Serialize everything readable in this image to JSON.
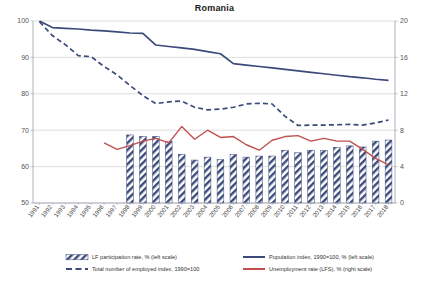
{
  "chart_data": {
    "type": "line",
    "title": "Romania",
    "xlabel": "",
    "ylabel_left": "",
    "ylabel_right": "",
    "grid": true,
    "legend_position": "bottom",
    "x": [
      1991,
      1992,
      1993,
      1994,
      1995,
      1996,
      1997,
      1998,
      1999,
      2000,
      2001,
      2002,
      2003,
      2004,
      2005,
      2006,
      2007,
      2008,
      2009,
      2010,
      2011,
      2012,
      2013,
      2014,
      2015,
      2016,
      2017,
      2018
    ],
    "left_axis": {
      "min": 50,
      "max": 100,
      "ticks": [
        50,
        60,
        70,
        80,
        90,
        100
      ]
    },
    "right_axis": {
      "min": 0,
      "max": 20,
      "ticks": [
        0,
        4,
        8,
        12,
        16,
        20
      ]
    },
    "series": [
      {
        "name": "LF participation rate, % (left scale)",
        "key": "lf_participation",
        "type": "bar",
        "axis": "left",
        "color": "#3b4a7a",
        "pattern": "diagonal-hatch",
        "values": [
          null,
          null,
          null,
          null,
          null,
          null,
          null,
          68.7,
          68.3,
          68.3,
          67.0,
          63.4,
          61.8,
          62.6,
          61.9,
          63.3,
          62.6,
          62.9,
          62.9,
          64.5,
          63.8,
          64.5,
          64.4,
          65.3,
          65.7,
          65.4,
          67.0,
          67.3
        ]
      },
      {
        "name": "Population index, 1990=100, % (left scale)",
        "key": "population_index",
        "type": "line",
        "axis": "left",
        "color": "#3b4a7a",
        "style": "solid",
        "values": [
          100.0,
          98.2,
          98.0,
          97.8,
          97.5,
          97.3,
          97.0,
          96.7,
          96.6,
          93.4,
          93.0,
          92.6,
          92.2,
          91.6,
          91.0,
          88.3,
          87.9,
          87.5,
          87.1,
          86.7,
          86.3,
          85.9,
          85.5,
          85.1,
          84.7,
          84.4,
          84.0,
          83.7
        ]
      },
      {
        "name": "Total number of employed index, 1990=100",
        "key": "employed_index",
        "type": "line",
        "axis": "left",
        "color": "#3b4a7a",
        "style": "dashed",
        "values": [
          99.8,
          96.0,
          93.5,
          90.5,
          90.2,
          87.5,
          85.2,
          82.3,
          79.5,
          77.3,
          77.8,
          78.0,
          76.3,
          75.6,
          75.8,
          76.3,
          77.2,
          77.4,
          77.2,
          73.8,
          71.3,
          71.4,
          71.4,
          71.5,
          71.6,
          71.4,
          72.0,
          72.8
        ]
      },
      {
        "name": "Unemployment rate (LFS), % (right scale)",
        "key": "unemployment_rate",
        "type": "line",
        "axis": "right",
        "color": "#c0504d",
        "style": "solid",
        "values": [
          null,
          null,
          null,
          null,
          null,
          6.6,
          5.9,
          6.3,
          6.8,
          7.1,
          6.6,
          8.4,
          7.0,
          8.0,
          7.2,
          7.3,
          6.4,
          5.8,
          6.9,
          7.3,
          7.4,
          6.8,
          7.1,
          6.8,
          6.8,
          5.9,
          4.9,
          4.2
        ]
      }
    ]
  },
  "legend": {
    "items": [
      {
        "label": "LF participation rate, % (left scale)",
        "marker": "hatch-bar-swatch",
        "color": "#3b4a7a"
      },
      {
        "label": "Population index, 1990=100, % (left scale)",
        "marker": "solid-line-swatch",
        "color": "#3b4a7a"
      },
      {
        "label": "Total number of employed index, 1990=100",
        "marker": "dashed-line-swatch",
        "color": "#3b4a7a"
      },
      {
        "label": "Unemployment rate (LFS), % (right scale)",
        "marker": "solid-line-swatch",
        "color": "#c0504d"
      }
    ]
  },
  "axes": {
    "left_ticks": [
      "100",
      "90",
      "80",
      "70",
      "60",
      "50"
    ],
    "right_ticks": [
      "20",
      "16",
      "12",
      "8",
      "4",
      "0"
    ],
    "year_ticks": [
      "1991",
      "1992",
      "1993",
      "1994",
      "1995",
      "1996",
      "1997",
      "1998",
      "1999",
      "2000",
      "2001",
      "2002",
      "2003",
      "2004",
      "2005",
      "2006",
      "2007",
      "2008",
      "2009",
      "2010",
      "2011",
      "2012",
      "2013",
      "2014",
      "2015",
      "2016",
      "2017",
      "2018"
    ]
  },
  "colors": {
    "series_blue": "#3b4a7a",
    "series_red": "#c0504d",
    "grid": "#c8c8c8",
    "axis": "#9aa0b0"
  }
}
